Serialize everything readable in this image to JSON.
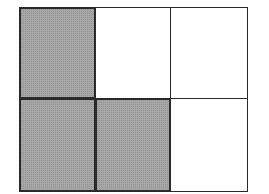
{
  "diagram": {
    "type": "fraction-grid",
    "rows": 2,
    "columns": 3,
    "total_cells": 6,
    "shaded_count": 3,
    "colors": {
      "shaded_fill": "#8c8c8c",
      "unshaded_fill": "#ffffff",
      "border": "#2a2a2a"
    },
    "cells": [
      {
        "row": 1,
        "col": 1,
        "shaded": true
      },
      {
        "row": 1,
        "col": 2,
        "shaded": false
      },
      {
        "row": 1,
        "col": 3,
        "shaded": false
      },
      {
        "row": 2,
        "col": 1,
        "shaded": true
      },
      {
        "row": 2,
        "col": 2,
        "shaded": true
      },
      {
        "row": 2,
        "col": 3,
        "shaded": false
      }
    ]
  }
}
